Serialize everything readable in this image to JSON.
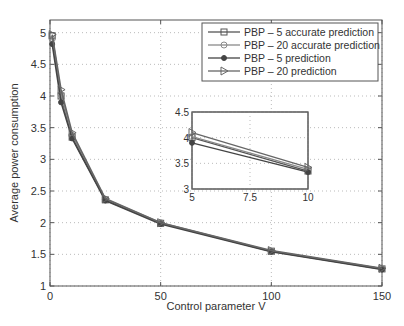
{
  "chart_data": {
    "type": "line",
    "title": "",
    "xlabel": "Control parameter V",
    "ylabel": "Average power consumption",
    "xlim": [
      0,
      150
    ],
    "ylim": [
      1,
      5.2
    ],
    "x_ticks": [
      "0",
      "50",
      "100",
      "150"
    ],
    "y_ticks": [
      "1",
      "1.5",
      "2",
      "2.5",
      "3",
      "3.5",
      "4",
      "4.5",
      "5"
    ],
    "grid": true,
    "legend_position": "upper right",
    "x": [
      1,
      5,
      10,
      25,
      50,
      100,
      150
    ],
    "series": [
      {
        "name": "PBP – 5 accurate prediction",
        "marker": "square",
        "values": [
          4.95,
          4.0,
          3.35,
          2.36,
          1.99,
          1.55,
          1.27
        ]
      },
      {
        "name": "PBP – 20 accurate prediction",
        "marker": "circle",
        "values": [
          4.9,
          4.02,
          3.38,
          2.37,
          2.0,
          1.55,
          1.27
        ]
      },
      {
        "name": "PBP – 5 prediction",
        "marker": "dot",
        "values": [
          4.82,
          3.9,
          3.33,
          2.35,
          1.98,
          1.54,
          1.26
        ]
      },
      {
        "name": "PBP – 20 prediction",
        "marker": "triangle-right",
        "values": [
          4.97,
          4.1,
          3.42,
          2.38,
          2.0,
          1.56,
          1.28
        ]
      }
    ],
    "inset": {
      "xlim": [
        5,
        10
      ],
      "ylim": [
        3,
        4.5
      ],
      "x_ticks": [
        "5",
        "7.5",
        "10"
      ],
      "y_ticks": [
        "3",
        "3.5",
        "4",
        "4.5"
      ]
    }
  }
}
